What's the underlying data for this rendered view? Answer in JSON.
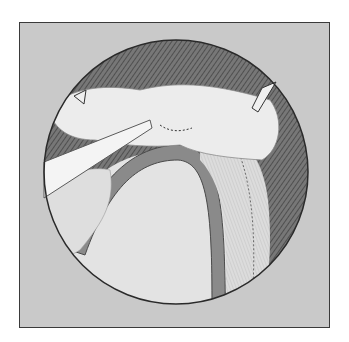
{
  "illustration": {
    "subject": "surgical-view",
    "colors": {
      "background": "#ffffff",
      "frame_fill": "#c9c9c9",
      "frame_border": "#3a3a3a",
      "circle_outline": "#2a2a2a",
      "dark_shadow": "#5a5a5a",
      "tissue_light": "#e8e8e8",
      "tissue_mid": "#d6d6d6"
    }
  }
}
